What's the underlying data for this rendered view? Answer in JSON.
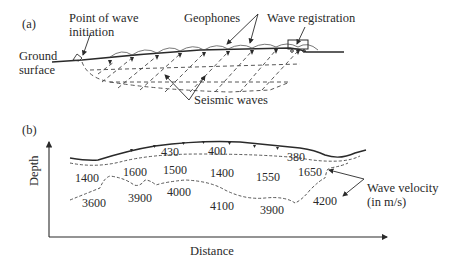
{
  "panel_a": {
    "label": "(a)",
    "point_of_wave_line1": "Point of wave",
    "point_of_wave_line2": "initiation",
    "geophones": "Geophones",
    "wave_registration": "Wave registration",
    "ground_line1": "Ground",
    "ground_line2": "surface",
    "seismic_waves": "Seismic waves"
  },
  "panel_b": {
    "label": "(b)",
    "ylabel": "Depth",
    "xlabel": "Distance",
    "wave_velocity_line1": "Wave velocity",
    "wave_velocity_line2": "(in m/s)",
    "layer1_velocities": [
      "430",
      "400",
      "380"
    ],
    "layer2_velocities": [
      "1400",
      "1600",
      "1500",
      "1400",
      "1550",
      "1650"
    ],
    "layer3_velocities": [
      "3600",
      "3900",
      "4000",
      "4100",
      "3900",
      "4200"
    ]
  }
}
